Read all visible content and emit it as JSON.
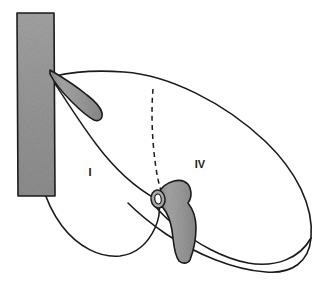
{
  "figure": {
    "background_color": "#ffffff",
    "outline_color": "#1b1b1b",
    "vessel_fill_color": "#9a9a9a",
    "vessel_fill_color_light": "#b0b0b0",
    "vessel_fill_color_dark": "#8a8a8a",
    "label_color": "#1a1a1a"
  },
  "labels": [
    {
      "id": "segment-1",
      "text": "I",
      "x": 90,
      "y": 176,
      "font_size": 11
    },
    {
      "id": "segment-4",
      "text": "IV",
      "x": 194,
      "y": 168,
      "font_size": 11
    }
  ],
  "structures": [
    {
      "id": "inferior-vena-cava",
      "name": "inferior vena cava",
      "style": "shaded-band",
      "shaded": true
    },
    {
      "id": "hepatic-vein-branch",
      "name": "hepatic vein branch",
      "style": "shaded-band",
      "shaded": true
    },
    {
      "id": "portal-structure",
      "name": "portal vein / porta hepatis",
      "style": "shaded-band",
      "shaded": true
    },
    {
      "id": "cut-vessel-ring",
      "name": "cut vessel lumen ring",
      "style": "ellipse-outline",
      "shaded": false
    },
    {
      "id": "liver-outline-right",
      "name": "right liver lobe outline",
      "style": "solid-curve",
      "shaded": false
    },
    {
      "id": "liver-outline-caudate",
      "name": "caudate lobe outline",
      "style": "solid-curve",
      "shaded": false
    },
    {
      "id": "fissure-solid",
      "name": "segmental fissure (solid)",
      "style": "solid-curve",
      "shaded": false
    },
    {
      "id": "fissure-dashed",
      "name": "segmental fissure (dashed)",
      "style": "dashed-curve",
      "shaded": false,
      "dash_pattern": "5,4"
    }
  ]
}
